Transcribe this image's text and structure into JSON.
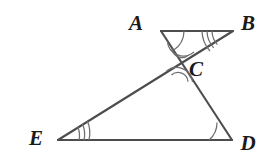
{
  "figure": {
    "background_color": "#ffffff",
    "line_color": "#4d4d4f",
    "mark_color": "#6f6f72",
    "label_color": "#1a1a1a",
    "points": {
      "A": {
        "label": "A",
        "x": 161,
        "y": 31,
        "label_x": 136,
        "label_y": 30
      },
      "B": {
        "label": "B",
        "x": 233,
        "y": 31,
        "label_x": 240,
        "label_y": 30
      },
      "C": {
        "label": "C",
        "x": 180,
        "y": 62,
        "label_x": 189,
        "label_y": 76
      },
      "D": {
        "label": "D",
        "x": 232,
        "y": 140,
        "label_x": 240,
        "label_y": 150
      },
      "E": {
        "label": "E",
        "x": 58,
        "y": 140,
        "label_x": 28,
        "label_y": 145
      }
    },
    "segments": [
      {
        "name": "segment-AB",
        "from": "A",
        "to": "B"
      },
      {
        "name": "segment-ED",
        "from": "E",
        "to": "D"
      },
      {
        "name": "segment-AD",
        "from": "A",
        "to": "D"
      },
      {
        "name": "segment-BE",
        "from": "B",
        "to": "E"
      }
    ],
    "angle_marks": [
      {
        "name": "angle-mark-A",
        "vertex": "A",
        "style": "arc",
        "count": 1
      },
      {
        "name": "angle-mark-B",
        "vertex": "B",
        "style": "tick",
        "count": 3
      },
      {
        "name": "angle-mark-C-upper",
        "vertex": "C",
        "style": "arc",
        "count": 2
      },
      {
        "name": "angle-mark-C-lower",
        "vertex": "C",
        "style": "arc",
        "count": 2
      },
      {
        "name": "angle-mark-D",
        "vertex": "D",
        "style": "arc",
        "count": 1
      },
      {
        "name": "angle-mark-E",
        "vertex": "E",
        "style": "tick",
        "count": 3
      }
    ]
  }
}
